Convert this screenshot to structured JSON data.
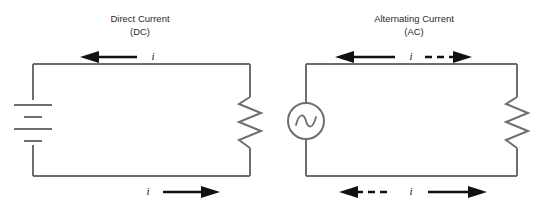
{
  "figure": {
    "background_color": "#ffffff",
    "wire_color": "#6e6e6e",
    "arrow_color": "#111111",
    "text_color": "#2b2b2b"
  },
  "panels": [
    {
      "id": "dc",
      "title_line1": "Direct Current",
      "title_line2": "(DC)",
      "source_type": "battery",
      "source_name": "battery-symbol",
      "load_type": "resistor",
      "load_name": "resistor-symbol",
      "top_current_label": "i",
      "top_current_direction": "left",
      "top_current_style": "solid",
      "bottom_current_label": "i",
      "bottom_current_direction": "right",
      "bottom_current_style": "solid",
      "battery_plates": [
        {
          "type": "long"
        },
        {
          "type": "short"
        },
        {
          "type": "long"
        },
        {
          "type": "short"
        }
      ]
    },
    {
      "id": "ac",
      "title_line1": "Alternating Current",
      "title_line2": "(AC)",
      "source_type": "ac-source",
      "source_name": "ac-source-symbol",
      "load_type": "resistor",
      "load_name": "resistor-symbol",
      "top_current_label": "i",
      "top_current_direction": "bidirectional",
      "top_current_style": "solid-left-dashed-right",
      "bottom_current_label": "i",
      "bottom_current_direction": "bidirectional",
      "bottom_current_style": "dashed-left-solid-right",
      "sine_glyph": "sine-wave"
    }
  ],
  "labels": {
    "dc_title_line1": "Direct Current",
    "dc_title_line2": "(DC)",
    "ac_title_line1": "Alternating Current",
    "ac_title_line2": "(AC)",
    "dc_top_i": "i",
    "dc_bottom_i": "i",
    "ac_top_i": "i",
    "ac_bottom_i": "i"
  }
}
